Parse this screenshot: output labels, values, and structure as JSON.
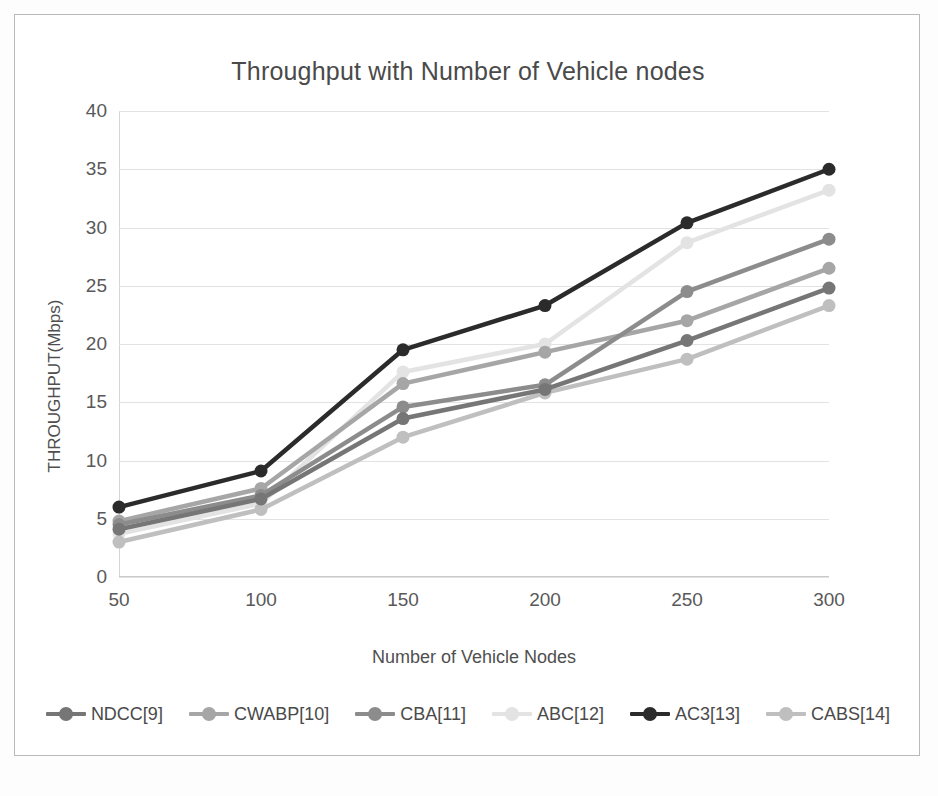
{
  "figure": {
    "title": "Throughput with Number of Vehicle nodes"
  },
  "axes": {
    "x_label": "Number of Vehicle Nodes",
    "y_label": "THROUGHPUT(Mbps)",
    "x_ticks": [
      "50",
      "100",
      "150",
      "200",
      "250",
      "300"
    ],
    "y_ticks": [
      "0",
      "5",
      "10",
      "15",
      "20",
      "25",
      "30",
      "35",
      "40"
    ]
  },
  "legend": {
    "items": [
      {
        "label": "NDCC[9]",
        "color": "#767676"
      },
      {
        "label": "CWABP[10]",
        "color": "#a6a6a6"
      },
      {
        "label": "CBA[11]",
        "color": "#8c8c8c"
      },
      {
        "label": "ABC[12]",
        "color": "#e3e3e3"
      },
      {
        "label": "AC3[13]",
        "color": "#2b2b2b"
      },
      {
        "label": "CABS[14]",
        "color": "#bfbfbf"
      }
    ]
  },
  "chart_data": {
    "type": "line",
    "title": "Throughput with Number of Vehicle nodes",
    "xlabel": "Number of Vehicle Nodes",
    "ylabel": "THROUGHPUT(Mbps)",
    "categories": [
      50,
      100,
      150,
      200,
      250,
      300
    ],
    "xlim": [
      50,
      300
    ],
    "ylim": [
      0,
      40
    ],
    "ytick_step": 5,
    "grid": true,
    "legend_position": "bottom",
    "series": [
      {
        "name": "NDCC[9]",
        "color": "#767676",
        "values": [
          4.1,
          6.7,
          13.6,
          16.1,
          20.3,
          24.8
        ]
      },
      {
        "name": "CWABP[10]",
        "color": "#a6a6a6",
        "values": [
          4.8,
          7.6,
          16.6,
          19.3,
          22.0,
          26.5
        ]
      },
      {
        "name": "CBA[11]",
        "color": "#8c8c8c",
        "values": [
          4.5,
          7.0,
          14.6,
          16.5,
          24.5,
          29.0
        ]
      },
      {
        "name": "ABC[12]",
        "color": "#e3e3e3",
        "values": [
          3.7,
          6.3,
          17.6,
          20.0,
          28.7,
          33.2
        ]
      },
      {
        "name": "AC3[13]",
        "color": "#2b2b2b",
        "values": [
          6.0,
          9.1,
          19.5,
          23.3,
          30.4,
          35.0
        ]
      },
      {
        "name": "CABS[14]",
        "color": "#bfbfbf",
        "values": [
          3.0,
          5.8,
          12.0,
          15.8,
          18.7,
          23.3
        ]
      }
    ]
  }
}
